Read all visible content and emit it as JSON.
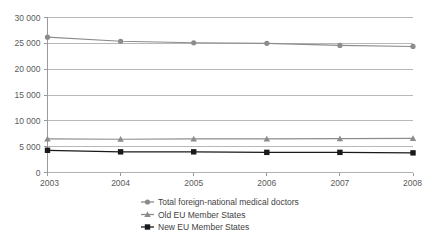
{
  "chart_data": {
    "type": "line",
    "title": "",
    "subtitle": "",
    "xlabel": "",
    "ylabel": "",
    "categories": [
      "2003",
      "2004",
      "2005",
      "2006",
      "2007",
      "2008"
    ],
    "x": [
      2003,
      2004,
      2005,
      2006,
      2007,
      2008
    ],
    "xlim": [
      2003,
      2008
    ],
    "ylim": [
      0,
      30000
    ],
    "y_ticks": [
      0,
      5000,
      10000,
      15000,
      20000,
      25000,
      30000
    ],
    "y_tick_labels": [
      "0",
      "5 000",
      "10 000",
      "15 000",
      "20 000",
      "25 000",
      "30 000"
    ],
    "x_tick_labels": [
      "2003",
      "2004",
      "2005",
      "2006",
      "2007",
      "2008"
    ],
    "grid": "horizontal",
    "legend_position": "bottom-center",
    "series": [
      {
        "name": "Total foreign-national medical doctors",
        "marker": "circle",
        "color": "#8c8c8c",
        "values": [
          26200,
          25400,
          25100,
          25000,
          24600,
          24400
        ]
      },
      {
        "name": "Old EU Member States",
        "marker": "triangle",
        "color": "#8c8c8c",
        "values": [
          6500,
          6450,
          6500,
          6500,
          6550,
          6600
        ]
      },
      {
        "name": "New EU Member States",
        "marker": "square",
        "color": "#1a1a1a",
        "values": [
          4300,
          4000,
          4000,
          3900,
          3900,
          3800
        ]
      }
    ]
  },
  "legend": {
    "items": [
      {
        "label": "Total foreign-national medical doctors",
        "marker": "circle-marker-icon",
        "color": "#8c8c8c"
      },
      {
        "label": "Old EU Member States",
        "marker": "triangle-marker-icon",
        "color": "#8c8c8c"
      },
      {
        "label": "New EU Member States",
        "marker": "square-marker-icon",
        "color": "#1a1a1a"
      }
    ]
  },
  "axes": {
    "y_labels": [
      "30 000",
      "25 000",
      "20 000",
      "15 000",
      "10 000",
      "5 000",
      "0"
    ],
    "x_labels": [
      "2003",
      "2004",
      "2005",
      "2006",
      "2007",
      "2008"
    ]
  },
  "colors": {
    "grid": "#b0b0b0",
    "axis": "#9a9a9a",
    "series_total": "#8c8c8c",
    "series_old_eu": "#8c8c8c",
    "series_new_eu": "#1a1a1a",
    "text": "#4a4a4a",
    "background": "#ffffff"
  }
}
